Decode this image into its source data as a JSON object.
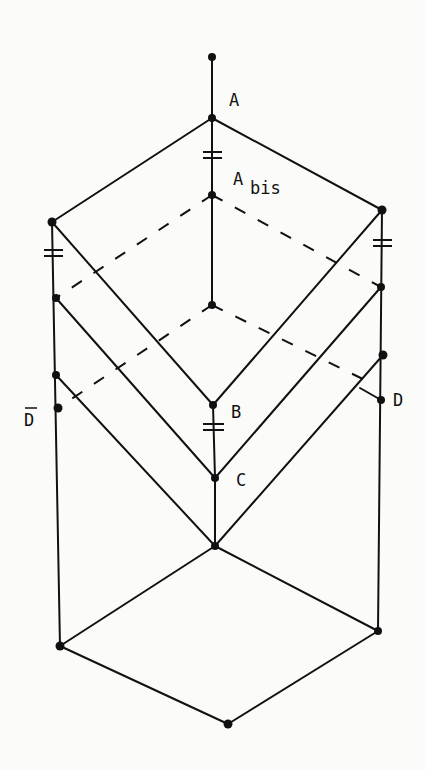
{
  "diagram": {
    "type": "lattice-hasse-diagram",
    "labels": {
      "A": "A",
      "Abis_main": "A",
      "Abis_sub": "bis",
      "B": "B",
      "C": "C",
      "D": "D",
      "Dbar": "D"
    },
    "nodes": [
      {
        "id": "top",
        "x": 212,
        "y": 57
      },
      {
        "id": "A",
        "x": 212,
        "y": 118
      },
      {
        "id": "Abis",
        "x": 212,
        "y": 195
      },
      {
        "id": "inner",
        "x": 212,
        "y": 305
      },
      {
        "id": "L1",
        "x": 52,
        "y": 222
      },
      {
        "id": "L2",
        "x": 56,
        "y": 298
      },
      {
        "id": "L3",
        "x": 56,
        "y": 375
      },
      {
        "id": "Dbar",
        "x": 58,
        "y": 408
      },
      {
        "id": "R1",
        "x": 382,
        "y": 210
      },
      {
        "id": "R2",
        "x": 381,
        "y": 287
      },
      {
        "id": "R3",
        "x": 383,
        "y": 355
      },
      {
        "id": "D",
        "x": 381,
        "y": 400
      },
      {
        "id": "B",
        "x": 213,
        "y": 405
      },
      {
        "id": "C",
        "x": 215,
        "y": 478
      },
      {
        "id": "M",
        "x": 215,
        "y": 546
      },
      {
        "id": "BL",
        "x": 60,
        "y": 646
      },
      {
        "id": "BB",
        "x": 228,
        "y": 724
      },
      {
        "id": "BR",
        "x": 378,
        "y": 631
      }
    ],
    "colors": {
      "ink": "#111111",
      "paper": "#fbfbf9"
    }
  }
}
